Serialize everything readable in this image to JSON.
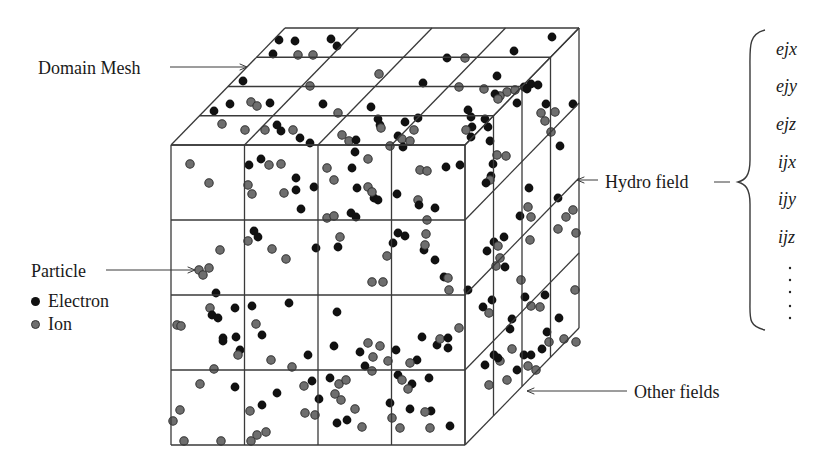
{
  "labels": {
    "domain_mesh": "Domain Mesh",
    "particle": "Particle",
    "hydro_field": "Hydro field",
    "other_fields": "Other fields"
  },
  "legend": {
    "items": [
      {
        "label": "Electron",
        "color": "#111111"
      },
      {
        "label": "Ion",
        "color": "#6e6e6e"
      }
    ]
  },
  "hydro_fields": [
    "ejx",
    "ejy",
    "ejz",
    "ijx",
    "ijy",
    "ijz"
  ],
  "colors": {
    "line": "#3a3a3a",
    "electron": "#111111",
    "ion": "#6e6e6e",
    "ion_stroke": "#333333"
  },
  "cube": {
    "front": {
      "x0": 171,
      "y0": 145,
      "x1": 465,
      "y1": 445
    },
    "depth": {
      "dx": 114,
      "dy": -117
    },
    "divisions": 4
  },
  "particles": {
    "front": [
      [
        "i",
        190,
        164
      ],
      [
        "i",
        209,
        183
      ],
      [
        "e",
        249,
        165
      ],
      [
        "e",
        261,
        159
      ],
      [
        "i",
        269,
        165
      ],
      [
        "i",
        281,
        164
      ],
      [
        "i",
        248,
        185
      ],
      [
        "i",
        252,
        194
      ],
      [
        "i",
        284,
        193
      ],
      [
        "e",
        296,
        178
      ],
      [
        "e",
        296,
        190
      ],
      [
        "e",
        314,
        187
      ],
      [
        "e",
        301,
        209
      ],
      [
        "i",
        327,
        168
      ],
      [
        "i",
        334,
        180
      ],
      [
        "e",
        352,
        168
      ],
      [
        "i",
        368,
        159
      ],
      [
        "e",
        357,
        188
      ],
      [
        "i",
        368,
        187
      ],
      [
        "e",
        374,
        198
      ],
      [
        "e",
        378,
        200
      ],
      [
        "i",
        372,
        192
      ],
      [
        "i",
        327,
        218
      ],
      [
        "i",
        334,
        216
      ],
      [
        "e",
        351,
        213
      ],
      [
        "e",
        356,
        217
      ],
      [
        "e",
        397,
        194
      ],
      [
        "i",
        420,
        170
      ],
      [
        "i",
        427,
        171
      ],
      [
        "i",
        418,
        200
      ],
      [
        "e",
        419,
        205
      ],
      [
        "i",
        427,
        220
      ],
      [
        "e",
        435,
        208
      ],
      [
        "e",
        446,
        167
      ],
      [
        "e",
        460,
        165
      ],
      [
        "e",
        393,
        243
      ],
      [
        "i",
        220,
        250
      ],
      [
        "e",
        254,
        231
      ],
      [
        "e",
        258,
        237
      ],
      [
        "i",
        248,
        241
      ],
      [
        "i",
        272,
        249
      ],
      [
        "i",
        286,
        259
      ],
      [
        "e",
        316,
        248
      ],
      [
        "e",
        338,
        247
      ],
      [
        "i",
        340,
        237
      ],
      [
        "i",
        372,
        282
      ],
      [
        "e",
        398,
        233
      ],
      [
        "e",
        405,
        236
      ],
      [
        "i",
        387,
        256
      ],
      [
        "i",
        383,
        282
      ],
      [
        "e",
        424,
        250
      ],
      [
        "i",
        426,
        234
      ],
      [
        "i",
        425,
        245
      ],
      [
        "e",
        435,
        260
      ],
      [
        "e",
        444,
        277
      ],
      [
        "e",
        468,
        290
      ],
      [
        "i",
        448,
        278
      ],
      [
        "i",
        449,
        290
      ],
      [
        "i",
        199,
        270
      ],
      [
        "i",
        209,
        268
      ],
      [
        "i",
        203,
        275
      ],
      [
        "i",
        177,
        325
      ],
      [
        "i",
        181,
        326
      ],
      [
        "e",
        216,
        293
      ],
      [
        "i",
        210,
        308
      ],
      [
        "e",
        212,
        315
      ],
      [
        "e",
        218,
        318
      ],
      [
        "e",
        223,
        338
      ],
      [
        "e",
        223,
        341
      ],
      [
        "e",
        235,
        308
      ],
      [
        "e",
        236,
        337
      ],
      [
        "e",
        240,
        350
      ],
      [
        "i",
        238,
        355
      ],
      [
        "i",
        214,
        369
      ],
      [
        "e",
        252,
        306
      ],
      [
        "i",
        256,
        324
      ],
      [
        "e",
        262,
        335
      ],
      [
        "e",
        289,
        303
      ],
      [
        "i",
        271,
        360
      ],
      [
        "i",
        292,
        367
      ],
      [
        "e",
        308,
        355
      ],
      [
        "e",
        312,
        381
      ],
      [
        "i",
        304,
        386
      ],
      [
        "i",
        305,
        413
      ],
      [
        "e",
        337,
        312
      ],
      [
        "e",
        334,
        346
      ],
      [
        "i",
        368,
        343
      ],
      [
        "i",
        380,
        346
      ],
      [
        "e",
        360,
        352
      ],
      [
        "i",
        373,
        357
      ],
      [
        "i",
        388,
        361
      ],
      [
        "e",
        396,
        350
      ],
      [
        "e",
        365,
        366
      ],
      [
        "e",
        398,
        375
      ],
      [
        "i",
        372,
        371
      ],
      [
        "e",
        330,
        378
      ],
      [
        "i",
        339,
        384
      ],
      [
        "i",
        346,
        380
      ],
      [
        "i",
        335,
        394
      ],
      [
        "i",
        341,
        400
      ],
      [
        "e",
        390,
        403
      ],
      [
        "e",
        417,
        360
      ],
      [
        "e",
        429,
        378
      ],
      [
        "e",
        422,
        337
      ],
      [
        "e",
        437,
        345
      ],
      [
        "i",
        440,
        339
      ],
      [
        "e",
        448,
        338
      ],
      [
        "e",
        448,
        348
      ],
      [
        "i",
        459,
        328
      ],
      [
        "i",
        410,
        363
      ],
      [
        "i",
        200,
        384
      ],
      [
        "i",
        180,
        410
      ],
      [
        "e",
        235,
        387
      ],
      [
        "e",
        262,
        405
      ],
      [
        "e",
        277,
        393
      ],
      [
        "i",
        250,
        411
      ],
      [
        "i",
        266,
        432
      ],
      [
        "i",
        257,
        435
      ],
      [
        "e",
        319,
        399
      ],
      [
        "i",
        315,
        415
      ],
      [
        "e",
        347,
        420
      ],
      [
        "i",
        355,
        409
      ],
      [
        "i",
        362,
        427
      ],
      [
        "e",
        337,
        423
      ],
      [
        "i",
        392,
        418
      ],
      [
        "i",
        400,
        428
      ],
      [
        "e",
        410,
        409
      ],
      [
        "e",
        431,
        411
      ],
      [
        "i",
        425,
        412
      ],
      [
        "i",
        430,
        428
      ],
      [
        "e",
        450,
        426
      ],
      [
        "i",
        173,
        421
      ],
      [
        "i",
        184,
        441
      ],
      [
        "i",
        221,
        441
      ],
      [
        "i",
        251,
        441
      ],
      [
        "e",
        412,
        384
      ],
      [
        "i",
        408,
        389
      ],
      [
        "i",
        402,
        380
      ]
    ],
    "top": [
      [
        "e",
        279,
        40
      ],
      [
        "e",
        295,
        41
      ],
      [
        "e",
        331,
        39
      ],
      [
        "e",
        337,
        46
      ],
      [
        "e",
        273,
        54
      ],
      [
        "i",
        298,
        55
      ],
      [
        "i",
        313,
        55
      ],
      [
        "e",
        447,
        58
      ],
      [
        "i",
        465,
        58
      ],
      [
        "e",
        514,
        51
      ],
      [
        "e",
        552,
        37
      ],
      [
        "e",
        243,
        81
      ],
      [
        "i",
        379,
        74
      ],
      [
        "e",
        423,
        83
      ],
      [
        "i",
        310,
        86
      ],
      [
        "i",
        459,
        87
      ],
      [
        "i",
        484,
        89
      ],
      [
        "e",
        524,
        87
      ],
      [
        "e",
        531,
        84
      ],
      [
        "e",
        497,
        76
      ],
      [
        "i",
        507,
        92
      ],
      [
        "i",
        515,
        90
      ],
      [
        "i",
        500,
        96
      ],
      [
        "e",
        230,
        104
      ],
      [
        "e",
        214,
        111
      ],
      [
        "i",
        251,
        102
      ],
      [
        "i",
        257,
        106
      ],
      [
        "e",
        270,
        103
      ],
      [
        "e",
        323,
        104
      ],
      [
        "i",
        338,
        113
      ],
      [
        "e",
        371,
        107
      ],
      [
        "e",
        378,
        119
      ],
      [
        "e",
        380,
        125
      ],
      [
        "i",
        381,
        128
      ],
      [
        "e",
        468,
        110
      ],
      [
        "e",
        471,
        117
      ],
      [
        "e",
        472,
        127
      ],
      [
        "i",
        466,
        130
      ],
      [
        "e",
        485,
        119
      ],
      [
        "e",
        488,
        127
      ],
      [
        "i",
        222,
        124
      ],
      [
        "i",
        245,
        130
      ],
      [
        "e",
        277,
        125
      ],
      [
        "i",
        265,
        130
      ],
      [
        "e",
        281,
        131
      ],
      [
        "i",
        293,
        130
      ],
      [
        "i",
        342,
        135
      ],
      [
        "i",
        349,
        141
      ],
      [
        "e",
        356,
        140
      ],
      [
        "e",
        300,
        138
      ],
      [
        "e",
        310,
        143
      ],
      [
        "e",
        398,
        136
      ],
      [
        "i",
        402,
        139
      ],
      [
        "e",
        403,
        147
      ],
      [
        "e",
        355,
        152
      ],
      [
        "i",
        390,
        146
      ],
      [
        "i",
        414,
        130
      ],
      [
        "i",
        410,
        141
      ],
      [
        "e",
        405,
        122
      ],
      [
        "e",
        418,
        118
      ]
    ],
    "right": [
      [
        "e",
        495,
        94
      ],
      [
        "i",
        498,
        99
      ],
      [
        "e",
        517,
        103
      ],
      [
        "e",
        527,
        89
      ],
      [
        "e",
        538,
        85
      ],
      [
        "e",
        546,
        104
      ],
      [
        "i",
        551,
        132
      ],
      [
        "e",
        560,
        146
      ],
      [
        "i",
        541,
        113
      ],
      [
        "i",
        545,
        121
      ],
      [
        "e",
        573,
        104
      ],
      [
        "i",
        555,
        112
      ],
      [
        "e",
        471,
        137
      ],
      [
        "e",
        490,
        141
      ],
      [
        "i",
        497,
        155
      ],
      [
        "i",
        506,
        156
      ],
      [
        "e",
        493,
        164
      ],
      [
        "e",
        491,
        176
      ],
      [
        "i",
        490,
        180
      ],
      [
        "e",
        486,
        183
      ],
      [
        "e",
        529,
        188
      ],
      [
        "i",
        528,
        207
      ],
      [
        "e",
        520,
        216
      ],
      [
        "i",
        531,
        217
      ],
      [
        "i",
        530,
        240
      ],
      [
        "i",
        558,
        229
      ],
      [
        "e",
        558,
        198
      ],
      [
        "i",
        573,
        210
      ],
      [
        "i",
        576,
        233
      ],
      [
        "i",
        566,
        217
      ],
      [
        "e",
        487,
        251
      ],
      [
        "e",
        494,
        242
      ],
      [
        "e",
        504,
        237
      ],
      [
        "e",
        505,
        267
      ],
      [
        "i",
        500,
        258
      ],
      [
        "i",
        496,
        266
      ],
      [
        "i",
        498,
        246
      ],
      [
        "i",
        521,
        280
      ],
      [
        "e",
        525,
        297
      ],
      [
        "i",
        531,
        306
      ],
      [
        "e",
        545,
        295
      ],
      [
        "i",
        575,
        290
      ],
      [
        "i",
        576,
        342
      ],
      [
        "e",
        559,
        318
      ],
      [
        "i",
        564,
        339
      ],
      [
        "i",
        540,
        307
      ],
      [
        "e",
        512,
        319
      ],
      [
        "e",
        492,
        300
      ],
      [
        "e",
        510,
        329
      ],
      [
        "i",
        500,
        361
      ],
      [
        "e",
        498,
        358
      ],
      [
        "i",
        512,
        349
      ],
      [
        "e",
        483,
        307
      ],
      [
        "i",
        489,
        313
      ],
      [
        "e",
        494,
        355
      ],
      [
        "e",
        524,
        355
      ],
      [
        "e",
        531,
        355
      ],
      [
        "i",
        536,
        370
      ],
      [
        "e",
        542,
        349
      ],
      [
        "i",
        549,
        342
      ],
      [
        "e",
        547,
        332
      ],
      [
        "e",
        517,
        370
      ],
      [
        "i",
        528,
        366
      ],
      [
        "i",
        489,
        385
      ],
      [
        "e",
        485,
        365
      ],
      [
        "i",
        507,
        380
      ]
    ]
  }
}
